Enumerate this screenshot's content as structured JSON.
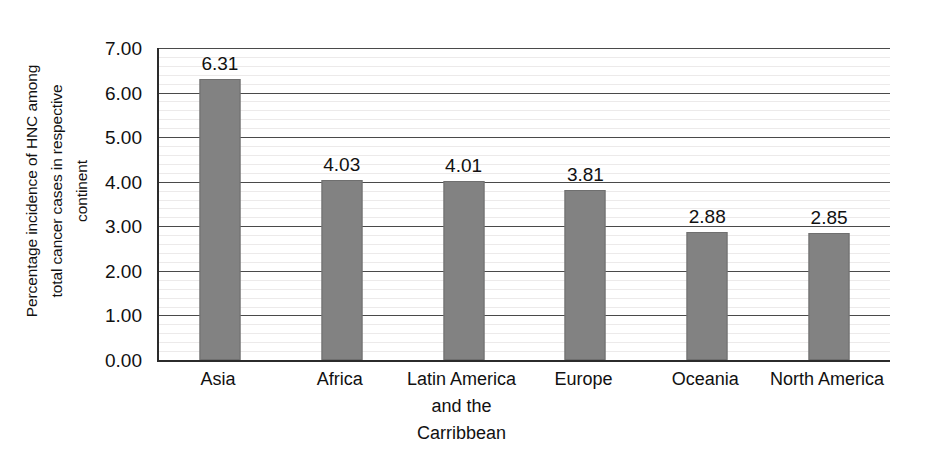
{
  "chart_data": {
    "type": "bar",
    "title": "",
    "xlabel": "",
    "ylabel": "Percentage incidence of HNC among\ntotal cancer cases in respective\ncontinent",
    "categories": [
      "Asia",
      "Africa",
      "Latin America\nand the\nCarribbean",
      "Europe",
      "Oceania",
      "North America"
    ],
    "values": [
      6.31,
      4.03,
      4.01,
      3.81,
      2.88,
      2.85
    ],
    "value_labels": [
      "6.31",
      "4.03",
      "4.01",
      "3.81",
      "2.88",
      "2.85"
    ],
    "ylim": [
      0,
      7
    ],
    "ytick_values": [
      7,
      6,
      5,
      4,
      3,
      2,
      1,
      0
    ],
    "ytick_labels": [
      "7.00",
      "6.00",
      "5.00",
      "4.00",
      "3.00",
      "2.00",
      "1.00",
      "0.00"
    ],
    "y_major_step": 1,
    "y_minor_step": 0.2,
    "grid": "horizontal-major-and-minor",
    "legend": "none",
    "bar_color": "#828282",
    "axis_color": "#2b2b2b",
    "major_gridline_color": "#4a4a4a",
    "minor_gridline_color": "#eceaea",
    "text_color": "#111111",
    "background_color": "#ffffff"
  }
}
